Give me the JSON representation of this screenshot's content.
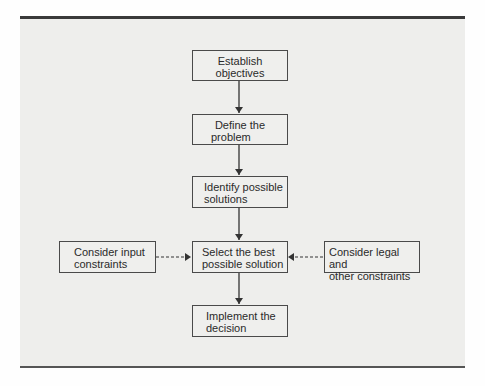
{
  "diagram": {
    "type": "flowchart",
    "nodes": [
      {
        "id": "establish",
        "label_line1": "Establish",
        "label_line2": "objectives"
      },
      {
        "id": "define",
        "label_line1": "Define the",
        "label_line2": "problem"
      },
      {
        "id": "identify",
        "label_line1": "Identify possible",
        "label_line2": "solutions"
      },
      {
        "id": "select",
        "label_line1": "Select the best",
        "label_line2": "possible solution"
      },
      {
        "id": "implement",
        "label_line1": "Implement the",
        "label_line2": "decision"
      },
      {
        "id": "input",
        "label_line1": "Consider input",
        "label_line2": "constraints"
      },
      {
        "id": "legal",
        "label_line1": "Consider legal and",
        "label_line2": "other constraints"
      }
    ],
    "edges": [
      {
        "from": "establish",
        "to": "define",
        "style": "solid"
      },
      {
        "from": "define",
        "to": "identify",
        "style": "solid"
      },
      {
        "from": "identify",
        "to": "select",
        "style": "solid"
      },
      {
        "from": "select",
        "to": "implement",
        "style": "solid"
      },
      {
        "from": "input",
        "to": "select",
        "style": "dashed"
      },
      {
        "from": "legal",
        "to": "select",
        "style": "dashed"
      }
    ]
  }
}
